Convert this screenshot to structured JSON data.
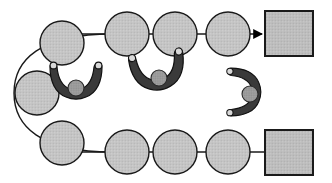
{
  "figure": {
    "title": "Robot gripper trajectory diagram",
    "background_color": "#ffffff"
  },
  "colors": {
    "circle_fill": "#c4c4c4",
    "circle_stroke": "#1a1a1a",
    "square_fill": "#bdbdbd",
    "square_stroke": "#1a1a1a",
    "gripper_fill": "#3a3a3a",
    "gripper_stroke": "#111111",
    "ball_fill": "#9a9a9a",
    "ball_stroke": "#2a2a2a",
    "fingertip_fill": "#d8d8d8",
    "path_stroke": "#1a1a1a",
    "arrow_fill": "#000000"
  },
  "geometry": {
    "width": 332,
    "height": 183,
    "circle_radius": 22,
    "stroke_width": 1.4
  },
  "paths": [
    {
      "name": "upper-track",
      "kind": "line-with-arrow",
      "d": "M 62 34 L 262 34",
      "arrowhead": true,
      "arrowhead_at": {
        "x": 262,
        "y": 34
      }
    },
    {
      "name": "lower-track",
      "kind": "line",
      "d": "M 62 152 L 268 152",
      "arrowhead": false
    },
    {
      "name": "left-return-curve",
      "kind": "curve",
      "d": "M 112 34 C 40 34 14 60 14 93 C 14 126 40 152 112 152",
      "arrowhead": false
    }
  ],
  "waypoints": {
    "label": "circular waypoint markers",
    "upper_row": [
      {
        "name": "waypoint-u1",
        "cx": 62,
        "cy": 43,
        "r": 22
      },
      {
        "name": "waypoint-u2",
        "cx": 127,
        "cy": 34,
        "r": 22
      },
      {
        "name": "waypoint-u3",
        "cx": 175,
        "cy": 34,
        "r": 22
      },
      {
        "name": "waypoint-u4",
        "cx": 228,
        "cy": 34,
        "r": 22
      }
    ],
    "left_column": [
      {
        "name": "waypoint-l1",
        "cx": 37,
        "cy": 93,
        "r": 22
      }
    ],
    "lower_row": [
      {
        "name": "waypoint-b1",
        "cx": 62,
        "cy": 143,
        "r": 22
      },
      {
        "name": "waypoint-b2",
        "cx": 127,
        "cy": 152,
        "r": 22
      },
      {
        "name": "waypoint-b3",
        "cx": 175,
        "cy": 152,
        "r": 22
      },
      {
        "name": "waypoint-b4",
        "cx": 228,
        "cy": 152,
        "r": 22
      }
    ]
  },
  "targets": [
    {
      "name": "target-square-top",
      "x": 265,
      "y": 11,
      "w": 48,
      "h": 45
    },
    {
      "name": "target-square-bottom",
      "x": 265,
      "y": 130,
      "w": 48,
      "h": 45
    }
  ],
  "grippers": [
    {
      "name": "gripper-left",
      "cx": 76,
      "cy": 83,
      "rotation": 0,
      "scale": 1.0,
      "holding_ball": true,
      "ball": {
        "cx": 76,
        "cy": 88,
        "r": 8
      },
      "state": "closed-around-ball"
    },
    {
      "name": "gripper-middle",
      "cx": 158,
      "cy": 73,
      "rotation": -8,
      "scale": 1.05,
      "holding_ball": true,
      "ball": {
        "cx": 159,
        "cy": 78,
        "r": 8
      },
      "state": "closed-around-ball"
    },
    {
      "name": "gripper-right",
      "cx": 246,
      "cy": 92,
      "rotation": -90,
      "scale": 0.92,
      "holding_ball": true,
      "ball": {
        "cx": 250,
        "cy": 94,
        "r": 8
      },
      "state": "open-facing-left"
    }
  ]
}
